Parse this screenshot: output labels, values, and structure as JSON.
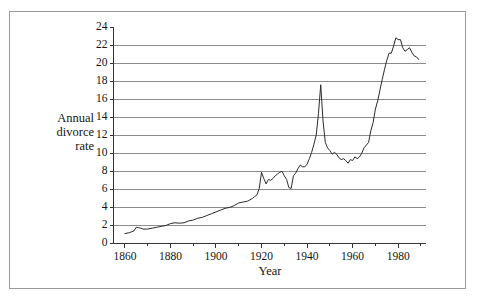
{
  "figure": {
    "frame_color": "#9a9a9a",
    "background": "#ffffff",
    "line_color": "#2b2b2b",
    "grid_color": "#8c8c8c",
    "axis_color": "#333333"
  },
  "labels": {
    "ylabel_line1": "Annual",
    "ylabel_line2": "divorce",
    "ylabel_line3": "rate",
    "xlabel": "Year"
  },
  "chart_data": {
    "type": "line",
    "title": "",
    "xlabel": "Year",
    "ylabel": "Annual divorce rate",
    "xlim": [
      1855,
      1992
    ],
    "ylim": [
      0,
      24
    ],
    "xticks": [
      1860,
      1880,
      1900,
      1920,
      1940,
      1960,
      1980
    ],
    "xtick_labels": [
      "1860",
      "1880",
      "1900",
      "1920",
      "1940",
      "1960",
      "1980"
    ],
    "xminor_ticks": [
      1870,
      1890,
      1910,
      1930,
      1950,
      1970,
      1990
    ],
    "yticks": [
      0,
      2,
      4,
      6,
      8,
      10,
      12,
      14,
      16,
      18,
      20,
      22,
      24
    ],
    "ytick_labels": [
      "0",
      "2",
      "4",
      "6",
      "8",
      "10",
      "12",
      "14",
      "16",
      "18",
      "20",
      "22",
      "24"
    ],
    "grid": "horizontal",
    "grid_values": [
      2,
      4,
      6,
      8,
      10,
      12,
      14,
      16,
      18,
      20,
      22
    ],
    "legend": "none",
    "series": [
      {
        "name": "Annual divorce rate",
        "x": [
          1860,
          1862,
          1864,
          1865,
          1866,
          1867,
          1868,
          1870,
          1872,
          1874,
          1876,
          1878,
          1880,
          1882,
          1884,
          1886,
          1888,
          1890,
          1892,
          1894,
          1896,
          1898,
          1900,
          1902,
          1904,
          1906,
          1908,
          1910,
          1912,
          1914,
          1916,
          1917,
          1918,
          1919,
          1920,
          1921,
          1922,
          1923,
          1924,
          1925,
          1926,
          1927,
          1928,
          1929,
          1930,
          1931,
          1932,
          1933,
          1934,
          1935,
          1936,
          1937,
          1938,
          1939,
          1940,
          1941,
          1942,
          1943,
          1944,
          1945,
          1946,
          1947,
          1948,
          1949,
          1950,
          1951,
          1952,
          1953,
          1954,
          1955,
          1956,
          1957,
          1958,
          1959,
          1960,
          1961,
          1962,
          1963,
          1964,
          1965,
          1966,
          1967,
          1968,
          1969,
          1970,
          1971,
          1972,
          1973,
          1974,
          1975,
          1976,
          1977,
          1978,
          1979,
          1980,
          1981,
          1982,
          1983,
          1984,
          1985,
          1986,
          1987,
          1988,
          1989
        ],
        "y": [
          1.1,
          1.2,
          1.4,
          1.8,
          1.75,
          1.7,
          1.6,
          1.6,
          1.7,
          1.8,
          1.9,
          2.0,
          2.2,
          2.3,
          2.25,
          2.3,
          2.5,
          2.6,
          2.8,
          2.9,
          3.1,
          3.3,
          3.5,
          3.7,
          3.9,
          4.0,
          4.2,
          4.5,
          4.6,
          4.7,
          5.0,
          5.2,
          5.4,
          6.1,
          7.9,
          7.2,
          6.6,
          7.1,
          7.0,
          7.2,
          7.5,
          7.7,
          7.9,
          8.0,
          7.5,
          7.1,
          6.2,
          6.1,
          7.5,
          7.8,
          8.3,
          8.7,
          8.5,
          8.5,
          8.8,
          9.4,
          10.1,
          11.0,
          12.0,
          14.4,
          17.6,
          13.6,
          11.2,
          10.6,
          10.3,
          9.9,
          10.1,
          9.9,
          9.5,
          9.3,
          9.4,
          9.2,
          8.9,
          9.3,
          9.2,
          9.6,
          9.4,
          9.6,
          10.0,
          10.6,
          10.9,
          11.2,
          12.5,
          13.4,
          14.9,
          15.8,
          17.0,
          18.2,
          19.3,
          20.3,
          21.1,
          21.1,
          21.9,
          22.8,
          22.6,
          22.6,
          21.7,
          21.3,
          21.5,
          21.7,
          21.2,
          20.8,
          20.7,
          20.4
        ]
      }
    ]
  }
}
